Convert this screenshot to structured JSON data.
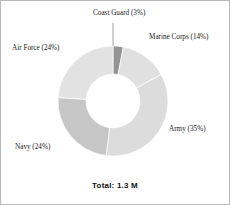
{
  "figure": {
    "total_caption": "Total: 1.3 M",
    "border_color": "#b9b9b9",
    "background": "#ffffff"
  },
  "labels": {
    "coast_guard": "Coast Guard (3%)",
    "marine_corps": "Marine Corps (14%)",
    "army": "Army (35%)",
    "navy": "Navy (24%)",
    "air_force": "Air Force (24%)"
  },
  "chart_data": {
    "type": "pie",
    "variant": "donut",
    "title": "",
    "subtitle": "",
    "annotation": "Total: 1.3 M",
    "total": "1.3 M",
    "units": "percent of total active duty personnel",
    "legend_position": "none",
    "labels_position": "outside-callout",
    "grid": false,
    "start_angle_deg": 0,
    "direction": "clockwise",
    "inner_radius_ratio": 0.49,
    "categories": [
      "Coast Guard",
      "Marine Corps",
      "Army",
      "Navy",
      "Air Force"
    ],
    "values": [
      3,
      14,
      35,
      24,
      24
    ],
    "value_labels": [
      "3%",
      "14%",
      "35%",
      "24%",
      "24%"
    ],
    "colors": [
      "#949494",
      "#e0e0e0",
      "#dcdcdc",
      "#c6c6c6",
      "#e2e2e2"
    ],
    "slices": [
      {
        "name": "Coast Guard",
        "value": 3,
        "label": "Coast Guard (3%)",
        "color": "#949494",
        "has_leader_line": true
      },
      {
        "name": "Marine Corps",
        "value": 14,
        "label": "Marine Corps (14%)",
        "color": "#e0e0e0",
        "has_leader_line": false
      },
      {
        "name": "Army",
        "value": 35,
        "label": "Army (35%)",
        "color": "#dcdcdc",
        "has_leader_line": false
      },
      {
        "name": "Navy",
        "value": 24,
        "label": "Navy (24%)",
        "color": "#c6c6c6",
        "has_leader_line": false
      },
      {
        "name": "Air Force",
        "value": 24,
        "label": "Air Force (24%)",
        "color": "#e2e2e2",
        "has_leader_line": false
      }
    ]
  }
}
